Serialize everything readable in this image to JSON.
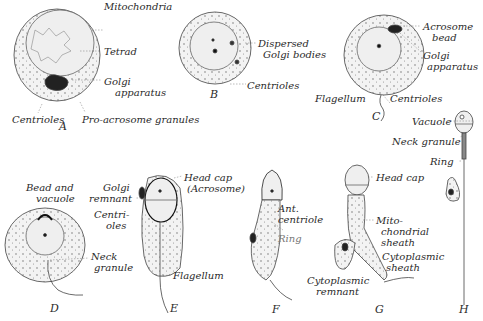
{
  "figure": {
    "stages": [
      {
        "id": "A",
        "labels": [
          "Mitochondria",
          "Tetrad",
          "Golgi apparatus",
          "Centrioles",
          "Pro-acrosome granules"
        ]
      },
      {
        "id": "B",
        "labels": [
          "Dispersed Golgi bodies",
          "Centrioles"
        ]
      },
      {
        "id": "C",
        "labels": [
          "Acrosome bead",
          "Golgi apparatus",
          "Flagellum",
          "Centrioles"
        ]
      },
      {
        "id": "D",
        "labels": [
          "Bead and vacuole",
          "Neck granule"
        ]
      },
      {
        "id": "E",
        "labels": [
          "Golgi remnant",
          "Centrioles",
          "Head cap (Acrosome)",
          "Flagellum"
        ]
      },
      {
        "id": "F",
        "labels": [
          "Ant. centriole",
          "Ring"
        ]
      },
      {
        "id": "G",
        "labels": [
          "Head cap",
          "Mito-chondrial sheath",
          "Cytoplasmic sheath",
          "Cytoplasmic remnant"
        ]
      },
      {
        "id": "H",
        "labels": [
          "Vacuole",
          "Neck granule",
          "Ring"
        ]
      }
    ]
  },
  "labels": {
    "a_mito": "Mitochondria",
    "a_tetrad": "Tetrad",
    "a_golgi1": "Golgi",
    "a_golgi2": "apparatus",
    "a_centrioles": "Centrioles",
    "a_proacro": "Pro-acrosome granules",
    "b_disp1": "Dispersed",
    "b_disp2": "Golgi bodies",
    "b_centrioles": "Centrioles",
    "c_acro1": "Acrosome",
    "c_acro2": "bead",
    "c_golgi1": "Golgi",
    "c_golgi2": "apparatus",
    "c_flag": "Flagellum",
    "c_centrioles": "Centrioles",
    "d_bead1": "Bead and",
    "d_bead2": "vacuole",
    "d_neck1": "Neck",
    "d_neck2": "granule",
    "e_golgi1": "Golgi",
    "e_golgi2": "remnant",
    "e_cent1": "Centri-",
    "e_cent2": "oles",
    "e_head1": "Head cap",
    "e_head2": "(Acrosome)",
    "e_flag": "Flagellum",
    "f_ant1": "Ant.",
    "f_ant2": "centriole",
    "f_ring": "Ring",
    "g_head": "Head cap",
    "g_mito1": "Mito-",
    "g_mito2": "chondrial",
    "g_mito3": "sheath",
    "g_cyto1": "Cytoplasmic",
    "g_cyto2": "sheath",
    "g_rem1": "Cytoplasmic",
    "g_rem2": "remnant",
    "h_vac": "Vacuole",
    "h_neck": "Neck granule",
    "h_ring": "Ring"
  },
  "stage_letters": {
    "A": "A",
    "B": "B",
    "C": "C",
    "D": "D",
    "E": "E",
    "F": "F",
    "G": "G",
    "H": "H"
  }
}
